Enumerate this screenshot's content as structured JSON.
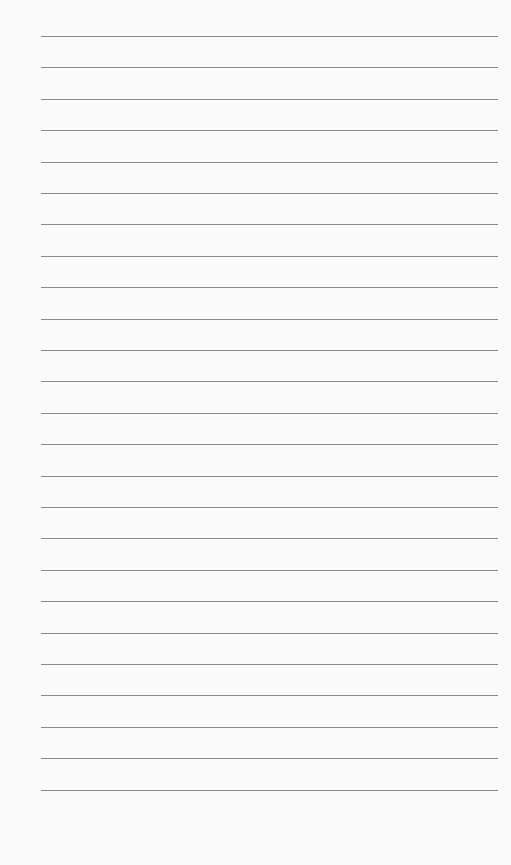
{
  "paper": {
    "type": "lined paper",
    "line_count": 25,
    "first_line_y": 36,
    "line_spacing": 31.4,
    "line_color": "#8a8a8a",
    "background_color": "#fafafa"
  }
}
